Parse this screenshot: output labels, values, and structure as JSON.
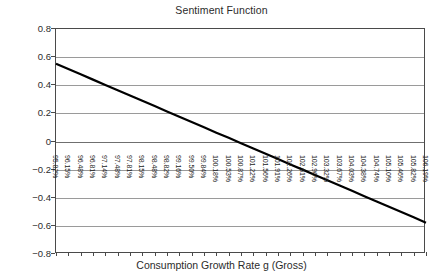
{
  "chart_data": {
    "type": "line",
    "title": "Sentiment Function",
    "xlabel": "Consumption Growth Rate g (Gross)",
    "ylabel": "",
    "grid": true,
    "legend": "none",
    "ylim": [
      -0.8,
      0.8
    ],
    "yticks": [
      "0.8",
      "0.6",
      "0.4",
      "0.2",
      "0",
      "-0.2",
      "-0.4",
      "-0.6",
      "-0.8"
    ],
    "ytick_values": [
      0.8,
      0.6,
      0.4,
      0.2,
      0,
      -0.2,
      -0.4,
      -0.6,
      -0.8
    ],
    "categories": [
      "95.82%",
      "96.15%",
      "96.48%",
      "96.81%",
      "97.14%",
      "97.48%",
      "97.81%",
      "98.15%",
      "98.48%",
      "98.82%",
      "99.16%",
      "99.50%",
      "99.84%",
      "100.18%",
      "100.53%",
      "100.87%",
      "101.22%",
      "101.56%",
      "101.91%",
      "102.26%",
      "102.61%",
      "102.96%",
      "103.32%",
      "103.67%",
      "104.03%",
      "104.38%",
      "104.74%",
      "105.10%",
      "105.46%",
      "105.82%",
      "106.19%"
    ],
    "series": [
      {
        "name": "Sentiment",
        "color": "#000000",
        "values": [
          0.553,
          0.515,
          0.478,
          0.44,
          0.402,
          0.365,
          0.327,
          0.289,
          0.252,
          0.214,
          0.176,
          0.139,
          0.101,
          0.063,
          0.026,
          -0.012,
          -0.05,
          -0.087,
          -0.125,
          -0.163,
          -0.2,
          -0.238,
          -0.276,
          -0.313,
          -0.351,
          -0.389,
          -0.426,
          -0.464,
          -0.502,
          -0.539,
          -0.577
        ]
      }
    ]
  },
  "colors": {
    "line": "#000000",
    "grid": "#9a9a9a",
    "axis": "#4a4a4a",
    "text": "#2b2b2b",
    "background": "#ffffff"
  }
}
